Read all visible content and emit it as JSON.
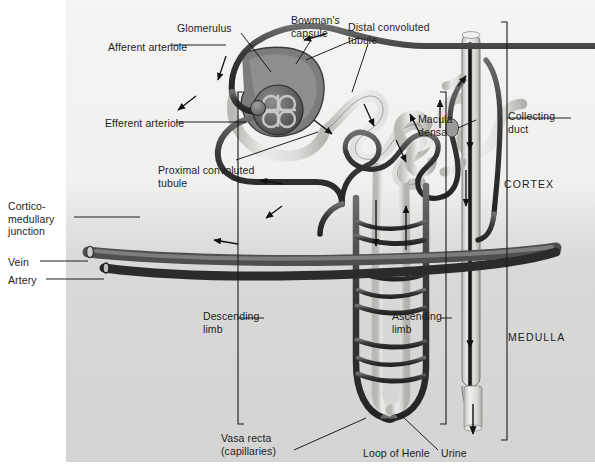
{
  "figure": {
    "regions": [
      {
        "name": "cortex",
        "label": "CORTEX",
        "x": 504,
        "y": 178
      },
      {
        "name": "medulla",
        "label": "MEDULLA",
        "x": 508,
        "y": 331
      }
    ],
    "labels": [
      {
        "name": "afferent-arteriole",
        "text": "Afferent arteriole",
        "x": 108,
        "y": 41,
        "align": "left"
      },
      {
        "name": "glomerulus",
        "text": "Glomerulus",
        "x": 177,
        "y": 22,
        "align": "left"
      },
      {
        "name": "bowmans-capsule",
        "text": "Bowman's\ncapsule",
        "x": 291,
        "y": 14,
        "align": "left"
      },
      {
        "name": "distal-convoluted-tubule",
        "text": "Distal convoluted\ntubule",
        "x": 348,
        "y": 21,
        "align": "left"
      },
      {
        "name": "efferent-arteriole",
        "text": "Efferent arteriole",
        "x": 105,
        "y": 117,
        "align": "left"
      },
      {
        "name": "proximal-convoluted-tubule",
        "text": "Proximal convoluted\ntubule",
        "x": 158,
        "y": 164,
        "align": "left"
      },
      {
        "name": "macula-densa",
        "text": "Macula\ndensa",
        "x": 418,
        "y": 113,
        "align": "left"
      },
      {
        "name": "collecting-duct",
        "text": "Collecting\nduct",
        "x": 508,
        "y": 110,
        "align": "left"
      },
      {
        "name": "cortico-medullary-junction",
        "text": "Cortico-\nmedullary\njunction",
        "x": 8,
        "y": 200,
        "align": "left"
      },
      {
        "name": "vein",
        "text": "Vein",
        "x": 8,
        "y": 258,
        "align": "left"
      },
      {
        "name": "artery",
        "text": "Artery",
        "x": 8,
        "y": 276,
        "align": "left"
      },
      {
        "name": "descending-limb",
        "text": "Descending\nlimb",
        "x": 203,
        "y": 310,
        "align": "left"
      },
      {
        "name": "ascending-limb",
        "text": "Ascending\nlimb",
        "x": 392,
        "y": 310,
        "align": "left"
      },
      {
        "name": "vasa-recta",
        "text": "Vasa recta\n(capillaries)",
        "x": 221,
        "y": 432,
        "align": "left"
      },
      {
        "name": "loop-of-henle",
        "text": "Loop of Henle",
        "x": 363,
        "y": 447,
        "align": "left"
      },
      {
        "name": "urine",
        "text": "Urine",
        "x": 441,
        "y": 447,
        "align": "left"
      }
    ],
    "colors": {
      "panel_cortex": "#f2f2f1",
      "panel_medulla": "#d7d7d6",
      "tubule_fill": "#e7e6e4",
      "tubule_outline": "#4a4a4a",
      "vessel_dark": "#3a3a3a",
      "glomerulus": "#6f6f6f",
      "label_text": "#1d1d1d",
      "leader_line": "#1a1a1a"
    }
  }
}
